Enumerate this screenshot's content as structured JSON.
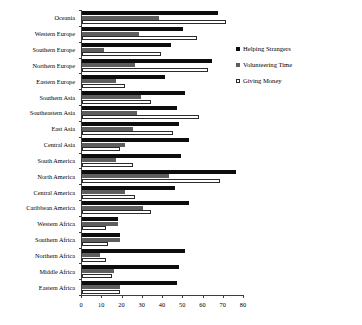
{
  "chart_data": {
    "type": "bar",
    "orientation": "horizontal",
    "title": "",
    "xlabel": "",
    "ylabel": "",
    "xlim": [
      0,
      80
    ],
    "xticks": [
      0,
      10,
      20,
      30,
      40,
      50,
      60,
      70,
      80
    ],
    "grid": false,
    "legend_position": "right",
    "categories": [
      "Oceania",
      "Western Europe",
      "Southern Europe",
      "Northern Europe",
      "Eastern Europe",
      "Southern Asia",
      "Southeastern Asia",
      "East Asia",
      "Central Asia",
      "South America",
      "North America",
      "Central America",
      "Caribbean America",
      "Western Africa",
      "Southern Africa",
      "Northern Africa",
      "Middle Africa",
      "Eastern Africa"
    ],
    "series": [
      {
        "name": "Helping Strangers",
        "color": "#0d0d0d",
        "values": [
          67,
          50,
          44,
          64,
          41,
          51,
          47,
          48,
          53,
          49,
          76,
          46,
          53,
          18,
          19,
          51,
          48,
          47
        ]
      },
      {
        "name": "Volunteering Time",
        "color": "#5e5e5e",
        "values": [
          38,
          28,
          11,
          26,
          17,
          29,
          27,
          25,
          21,
          17,
          43,
          21,
          30,
          18,
          19,
          9,
          16,
          19
        ]
      },
      {
        "name": "Giving Money",
        "color": "#ffffff",
        "values": [
          71,
          57,
          39,
          62,
          21,
          34,
          58,
          45,
          19,
          25,
          68,
          26,
          34,
          12,
          13,
          12,
          15,
          19
        ]
      }
    ]
  },
  "legend": {
    "items": [
      {
        "label": "Helping Strangers",
        "swatch": "helping"
      },
      {
        "label": "Volunteering Time",
        "swatch": "volunteering"
      },
      {
        "label": "Giving Money",
        "swatch": "giving"
      }
    ]
  }
}
